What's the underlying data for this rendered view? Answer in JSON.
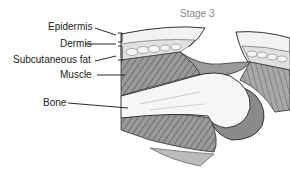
{
  "title": "Stage 3",
  "labels": {
    "epidermis": "Epidermis",
    "dermis": "Dermis",
    "subcutaneous_fat": "Subcutaneous fat",
    "muscle": "Muscle",
    "bone": "Bone"
  },
  "colors": {
    "outline": "#3a3a3a",
    "skin": "#f0f0f0",
    "fat": "#e2e2e2",
    "muscle_dark": "#7a7a7a",
    "muscle_light": "#b8b8b8",
    "bone": "#f6f6f6",
    "wound_bed": "#9a9a9a",
    "title": "#8a8a8a"
  }
}
